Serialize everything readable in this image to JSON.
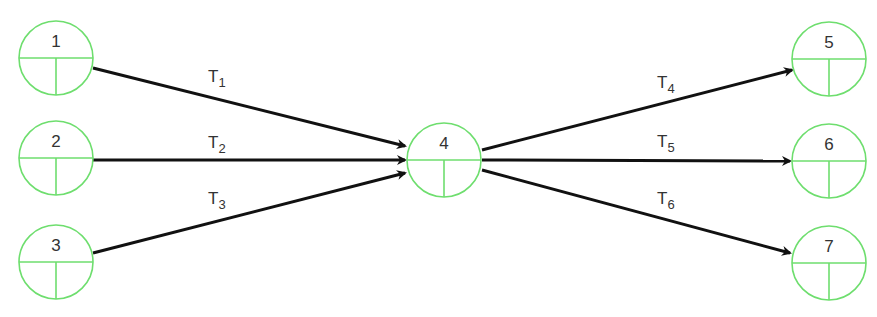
{
  "diagram": {
    "type": "activity-network",
    "colors": {
      "node_stroke": "#6ede6e",
      "edge": "#111111",
      "text": "#333333"
    },
    "nodes": [
      {
        "id": "1",
        "label": "1",
        "cx": 56,
        "cy": 58,
        "r": 37
      },
      {
        "id": "2",
        "label": "2",
        "cx": 56,
        "cy": 158,
        "r": 37
      },
      {
        "id": "3",
        "label": "3",
        "cx": 56,
        "cy": 262,
        "r": 37
      },
      {
        "id": "4",
        "label": "4",
        "cx": 444,
        "cy": 160,
        "r": 37
      },
      {
        "id": "5",
        "label": "5",
        "cx": 829,
        "cy": 59,
        "r": 37
      },
      {
        "id": "6",
        "label": "6",
        "cx": 829,
        "cy": 161,
        "r": 37
      },
      {
        "id": "7",
        "label": "7",
        "cx": 829,
        "cy": 263,
        "r": 37
      }
    ],
    "edges": [
      {
        "id": "T1",
        "from": "1",
        "to": "4",
        "label_main": "T",
        "label_sub": "1",
        "x1": 93,
        "y1": 68,
        "x2": 405,
        "y2": 146,
        "lx": 208,
        "ly": 82
      },
      {
        "id": "T2",
        "from": "2",
        "to": "4",
        "label_main": "T",
        "label_sub": "2",
        "x1": 93,
        "y1": 160,
        "x2": 405,
        "y2": 160,
        "lx": 208,
        "ly": 148
      },
      {
        "id": "T3",
        "from": "3",
        "to": "4",
        "label_main": "T",
        "label_sub": "3",
        "x1": 93,
        "y1": 253,
        "x2": 405,
        "y2": 173,
        "lx": 208,
        "ly": 204
      },
      {
        "id": "T4",
        "from": "4",
        "to": "5",
        "label_main": "T",
        "label_sub": "4",
        "x1": 482,
        "y1": 150,
        "x2": 792,
        "y2": 70,
        "lx": 657,
        "ly": 88
      },
      {
        "id": "T5",
        "from": "4",
        "to": "6",
        "label_main": "T",
        "label_sub": "5",
        "x1": 482,
        "y1": 160,
        "x2": 790,
        "y2": 161,
        "lx": 657,
        "ly": 147
      },
      {
        "id": "T6",
        "from": "4",
        "to": "7",
        "label_main": "T",
        "label_sub": "6",
        "x1": 482,
        "y1": 170,
        "x2": 790,
        "y2": 253,
        "lx": 657,
        "ly": 204
      }
    ]
  }
}
